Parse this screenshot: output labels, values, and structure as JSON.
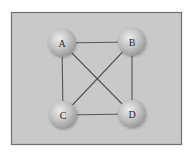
{
  "diagram": {
    "type": "graph",
    "nodes": [
      {
        "id": "A",
        "label": "A"
      },
      {
        "id": "B",
        "label": "B"
      },
      {
        "id": "C",
        "label": "C"
      },
      {
        "id": "D",
        "label": "D"
      }
    ],
    "edges": [
      {
        "from": "A",
        "to": "B"
      },
      {
        "from": "A",
        "to": "C"
      },
      {
        "from": "A",
        "to": "D"
      },
      {
        "from": "B",
        "to": "C"
      },
      {
        "from": "B",
        "to": "D"
      },
      {
        "from": "C",
        "to": "D"
      }
    ],
    "colors": {
      "panel_fill": "#c9c9c9",
      "panel_border": "#6f6f6f",
      "edge": "#555555",
      "node_highlight": "#ececec",
      "node_mid": "#c4c4c4",
      "node_edge": "#9a9a9a",
      "label": "#2a2a2a"
    }
  }
}
